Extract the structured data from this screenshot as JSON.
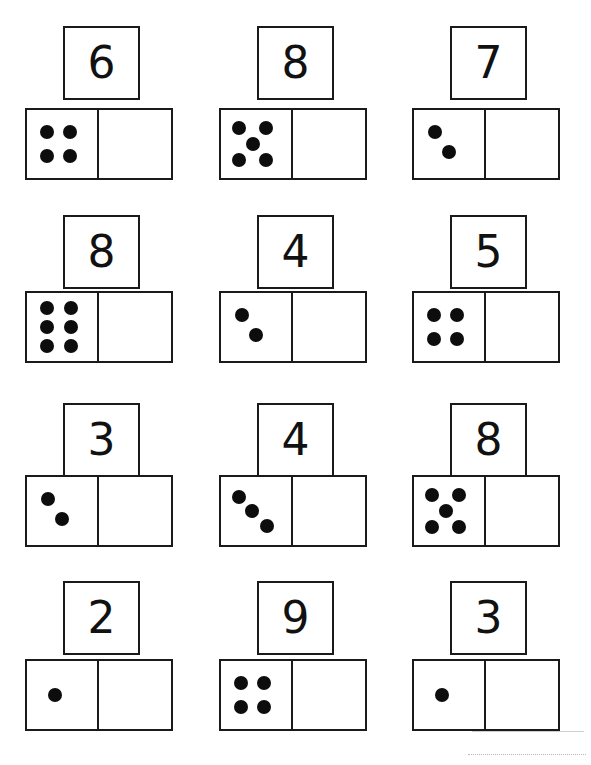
{
  "worksheet": {
    "title": "Domino Make-the-Number Worksheet",
    "columns": 3,
    "rows": 4,
    "ink_color": "#1a1a1a",
    "pip_color": "#0d0d0d",
    "paper_color": "#ffffff"
  },
  "layout": {
    "column_x": [
      25,
      219,
      412
    ],
    "numbox_x": [
      63,
      257,
      450
    ],
    "row_numbox_y": [
      26,
      215,
      403,
      581
    ],
    "row_domino_y": [
      108,
      291,
      475,
      659
    ],
    "numbox_w": 77,
    "numbox_h": 74,
    "domino_w": 148,
    "domino_h": 72,
    "pip_diameter": 14,
    "digit_font_size": 44
  },
  "pip_patterns": {
    "1": [
      [
        40,
        50
      ]
    ],
    "2": [
      [
        30,
        33
      ],
      [
        50,
        62
      ]
    ],
    "3": [
      [
        25,
        30
      ],
      [
        44,
        50
      ],
      [
        66,
        72
      ]
    ],
    "4": [
      [
        28,
        32
      ],
      [
        62,
        32
      ],
      [
        28,
        68
      ],
      [
        62,
        68
      ]
    ],
    "5": [
      [
        26,
        27
      ],
      [
        64,
        27
      ],
      [
        45,
        50
      ],
      [
        26,
        73
      ],
      [
        64,
        73
      ]
    ],
    "6": [
      [
        29,
        22
      ],
      [
        63,
        22
      ],
      [
        29,
        50
      ],
      [
        63,
        50
      ],
      [
        29,
        78
      ],
      [
        63,
        78
      ]
    ]
  },
  "items": [
    {
      "id": "item-1",
      "row": 0,
      "col": 0,
      "target": "6",
      "pips": 6,
      "dots": 4,
      "empty_side": "right"
    },
    {
      "id": "item-2",
      "row": 0,
      "col": 1,
      "target": "8",
      "pips": 8,
      "dots": 5,
      "empty_side": "right"
    },
    {
      "id": "item-3",
      "row": 0,
      "col": 2,
      "target": "7",
      "pips": 7,
      "dots": 2,
      "empty_side": "right"
    },
    {
      "id": "item-4",
      "row": 1,
      "col": 0,
      "target": "8",
      "pips": 8,
      "dots": 6,
      "empty_side": "right"
    },
    {
      "id": "item-5",
      "row": 1,
      "col": 1,
      "target": "4",
      "pips": 4,
      "dots": 2,
      "empty_side": "right"
    },
    {
      "id": "item-6",
      "row": 1,
      "col": 2,
      "target": "5",
      "pips": 5,
      "dots": 4,
      "empty_side": "right"
    },
    {
      "id": "item-7",
      "row": 2,
      "col": 0,
      "target": "3",
      "pips": 3,
      "dots": 2,
      "empty_side": "right"
    },
    {
      "id": "item-8",
      "row": 2,
      "col": 1,
      "target": "4",
      "pips": 4,
      "dots": 3,
      "empty_side": "right"
    },
    {
      "id": "item-9",
      "row": 2,
      "col": 2,
      "target": "8",
      "pips": 8,
      "dots": 5,
      "empty_side": "right"
    },
    {
      "id": "item-10",
      "row": 3,
      "col": 0,
      "target": "2",
      "pips": 2,
      "dots": 1,
      "empty_side": "right"
    },
    {
      "id": "item-11",
      "row": 3,
      "col": 1,
      "target": "9",
      "pips": 9,
      "dots": 4,
      "empty_side": "right"
    },
    {
      "id": "item-12",
      "row": 3,
      "col": 2,
      "target": "3",
      "pips": 3,
      "dots": 1,
      "empty_side": "right"
    }
  ],
  "artifacts": {
    "dashed_line": {
      "x": 468,
      "y": 754,
      "width": 118
    },
    "edge_smudge": {
      "x": 472,
      "y": 731,
      "width": 112,
      "height": 1
    }
  }
}
